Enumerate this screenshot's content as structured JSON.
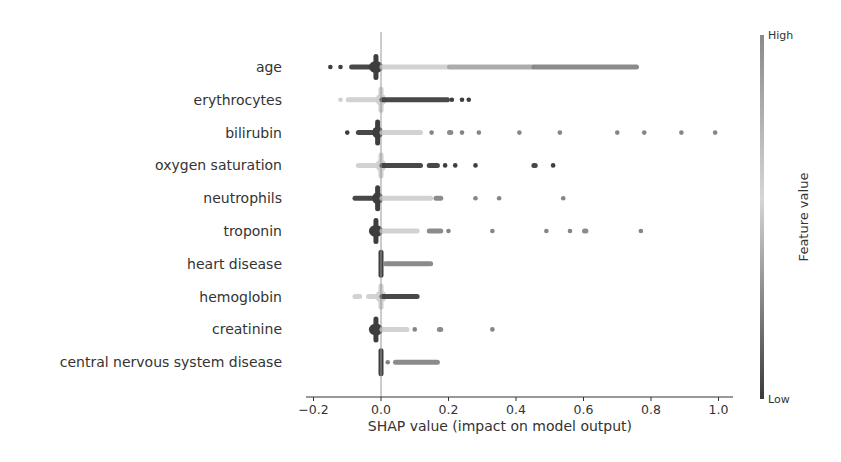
{
  "chart_data": {
    "type": "scatter",
    "subtype": "shap_beeswarm_summary",
    "title": "",
    "xlabel": "SHAP value (impact on model output)",
    "ylabel": "",
    "xlim": [
      -0.2,
      1.03
    ],
    "xticks": [
      -0.2,
      0.0,
      0.2,
      0.4,
      0.6,
      0.8,
      1.0
    ],
    "xtick_labels": [
      "−0.2",
      "0.0",
      "0.2",
      "0.4",
      "0.6",
      "0.8",
      "1.0"
    ],
    "grid": false,
    "colorbar": {
      "label": "Feature value",
      "high_label": "High",
      "low_label": "Low",
      "high_color": "#8a8a8a",
      "mid_color": "#d6d6d6",
      "low_color": "#3a3a3a"
    },
    "features": [
      {
        "name": "age",
        "clusters": [
          {
            "from": -0.15,
            "to": -0.15,
            "shade": "low",
            "kind": "dot"
          },
          {
            "from": -0.12,
            "to": -0.12,
            "shade": "low",
            "kind": "dot"
          },
          {
            "from": -0.09,
            "to": -0.02,
            "shade": "low",
            "kind": "bar"
          },
          {
            "from": -0.03,
            "to": 0.0,
            "shade": "low",
            "kind": "blob"
          },
          {
            "from": 0.0,
            "to": 0.2,
            "shade": "mid",
            "kind": "bar"
          },
          {
            "from": 0.2,
            "to": 0.45,
            "shade": "midhigh",
            "kind": "bar"
          },
          {
            "from": 0.45,
            "to": 0.76,
            "shade": "high",
            "kind": "bar"
          }
        ]
      },
      {
        "name": "erythrocytes",
        "clusters": [
          {
            "from": -0.12,
            "to": -0.12,
            "shade": "mid",
            "kind": "dot"
          },
          {
            "from": -0.1,
            "to": -0.01,
            "shade": "mid",
            "kind": "bar"
          },
          {
            "from": -0.01,
            "to": 0.01,
            "shade": "mid",
            "kind": "blob"
          },
          {
            "from": 0.0,
            "to": 0.2,
            "shade": "low",
            "kind": "bar"
          },
          {
            "from": 0.21,
            "to": 0.21,
            "shade": "low",
            "kind": "dot"
          },
          {
            "from": 0.24,
            "to": 0.24,
            "shade": "low",
            "kind": "dot"
          },
          {
            "from": 0.26,
            "to": 0.26,
            "shade": "low",
            "kind": "dot"
          }
        ]
      },
      {
        "name": "bilirubin",
        "clusters": [
          {
            "from": -0.1,
            "to": -0.1,
            "shade": "low",
            "kind": "dot"
          },
          {
            "from": -0.07,
            "to": 0.0,
            "shade": "low",
            "kind": "bar"
          },
          {
            "from": -0.02,
            "to": 0.0,
            "shade": "low",
            "kind": "blob"
          },
          {
            "from": 0.0,
            "to": 0.12,
            "shade": "mid",
            "kind": "bar"
          },
          {
            "from": 0.15,
            "to": 0.15,
            "shade": "high",
            "kind": "dot"
          },
          {
            "from": 0.2,
            "to": 0.21,
            "shade": "high",
            "kind": "bar"
          },
          {
            "from": 0.24,
            "to": 0.24,
            "shade": "high",
            "kind": "dot"
          },
          {
            "from": 0.29,
            "to": 0.29,
            "shade": "high",
            "kind": "dot"
          },
          {
            "from": 0.41,
            "to": 0.41,
            "shade": "high",
            "kind": "dot"
          },
          {
            "from": 0.53,
            "to": 0.53,
            "shade": "high",
            "kind": "dot"
          },
          {
            "from": 0.7,
            "to": 0.7,
            "shade": "high",
            "kind": "dot"
          },
          {
            "from": 0.78,
            "to": 0.78,
            "shade": "high",
            "kind": "dot"
          },
          {
            "from": 0.89,
            "to": 0.89,
            "shade": "high",
            "kind": "dot"
          },
          {
            "from": 0.99,
            "to": 0.99,
            "shade": "high",
            "kind": "dot"
          }
        ]
      },
      {
        "name": "oxygen saturation",
        "clusters": [
          {
            "from": -0.07,
            "to": -0.01,
            "shade": "mid",
            "kind": "bar"
          },
          {
            "from": -0.01,
            "to": 0.01,
            "shade": "mid",
            "kind": "blob"
          },
          {
            "from": 0.0,
            "to": 0.12,
            "shade": "low",
            "kind": "bar"
          },
          {
            "from": 0.14,
            "to": 0.17,
            "shade": "low",
            "kind": "bar"
          },
          {
            "from": 0.19,
            "to": 0.19,
            "shade": "low",
            "kind": "dot"
          },
          {
            "from": 0.22,
            "to": 0.22,
            "shade": "low",
            "kind": "dot"
          },
          {
            "from": 0.28,
            "to": 0.28,
            "shade": "low",
            "kind": "dot"
          },
          {
            "from": 0.45,
            "to": 0.46,
            "shade": "low",
            "kind": "bar"
          },
          {
            "from": 0.51,
            "to": 0.51,
            "shade": "low",
            "kind": "dot"
          }
        ]
      },
      {
        "name": "neutrophils",
        "clusters": [
          {
            "from": -0.08,
            "to": 0.0,
            "shade": "low",
            "kind": "bar"
          },
          {
            "from": -0.02,
            "to": 0.0,
            "shade": "low",
            "kind": "blob"
          },
          {
            "from": 0.0,
            "to": 0.15,
            "shade": "mid",
            "kind": "bar"
          },
          {
            "from": 0.16,
            "to": 0.18,
            "shade": "high",
            "kind": "bar"
          },
          {
            "from": 0.28,
            "to": 0.28,
            "shade": "high",
            "kind": "dot"
          },
          {
            "from": 0.35,
            "to": 0.35,
            "shade": "high",
            "kind": "dot"
          },
          {
            "from": 0.54,
            "to": 0.54,
            "shade": "high",
            "kind": "dot"
          }
        ]
      },
      {
        "name": "troponin",
        "clusters": [
          {
            "from": -0.03,
            "to": 0.0,
            "shade": "low",
            "kind": "blob"
          },
          {
            "from": 0.0,
            "to": 0.11,
            "shade": "mid",
            "kind": "bar"
          },
          {
            "from": 0.14,
            "to": 0.18,
            "shade": "high",
            "kind": "bar"
          },
          {
            "from": 0.2,
            "to": 0.2,
            "shade": "high",
            "kind": "dot"
          },
          {
            "from": 0.33,
            "to": 0.33,
            "shade": "high",
            "kind": "dot"
          },
          {
            "from": 0.49,
            "to": 0.49,
            "shade": "high",
            "kind": "dot"
          },
          {
            "from": 0.56,
            "to": 0.56,
            "shade": "high",
            "kind": "dot"
          },
          {
            "from": 0.6,
            "to": 0.61,
            "shade": "high",
            "kind": "bar"
          },
          {
            "from": 0.77,
            "to": 0.77,
            "shade": "high",
            "kind": "dot"
          }
        ]
      },
      {
        "name": "heart disease",
        "clusters": [
          {
            "from": -0.005,
            "to": 0.005,
            "shade": "low",
            "kind": "column"
          },
          {
            "from": 0.01,
            "to": 0.15,
            "shade": "high",
            "kind": "bar"
          }
        ]
      },
      {
        "name": "hemoglobin",
        "clusters": [
          {
            "from": -0.08,
            "to": -0.06,
            "shade": "mid",
            "kind": "bar"
          },
          {
            "from": -0.04,
            "to": 0.0,
            "shade": "mid",
            "kind": "bar"
          },
          {
            "from": -0.01,
            "to": 0.01,
            "shade": "mid",
            "kind": "blob"
          },
          {
            "from": 0.0,
            "to": 0.11,
            "shade": "low",
            "kind": "bar"
          }
        ]
      },
      {
        "name": "creatinine",
        "clusters": [
          {
            "from": -0.03,
            "to": 0.0,
            "shade": "low",
            "kind": "blob"
          },
          {
            "from": 0.0,
            "to": 0.08,
            "shade": "mid",
            "kind": "bar"
          },
          {
            "from": 0.1,
            "to": 0.1,
            "shade": "high",
            "kind": "dot"
          },
          {
            "from": 0.17,
            "to": 0.18,
            "shade": "high",
            "kind": "bar"
          },
          {
            "from": 0.33,
            "to": 0.33,
            "shade": "high",
            "kind": "dot"
          }
        ]
      },
      {
        "name": "central nervous system disease",
        "clusters": [
          {
            "from": -0.005,
            "to": 0.005,
            "shade": "low",
            "kind": "column"
          },
          {
            "from": 0.02,
            "to": 0.02,
            "shade": "high",
            "kind": "dot"
          },
          {
            "from": 0.04,
            "to": 0.17,
            "shade": "high",
            "kind": "bar"
          }
        ]
      }
    ]
  },
  "layout": {
    "x_zero_px": 381,
    "px_per_unit": 337.5,
    "row_top_px": 67,
    "row_step_px": 32.8,
    "axis_y_px": 397,
    "axis_left_px": 306,
    "axis_right_px": 733,
    "zero_line_top_px": 32,
    "colorbar": {
      "x_px": 760,
      "top_px": 35,
      "bottom_px": 399,
      "width_px": 4
    }
  }
}
